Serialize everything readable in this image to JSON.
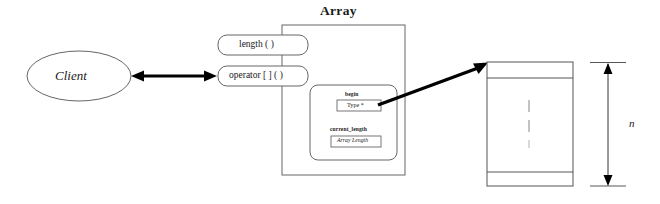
{
  "diagram": {
    "title": "Array",
    "actor": {
      "label": "Client",
      "shape": "ellipse"
    },
    "methods": [
      {
        "label": "length ( )",
        "name": "length-method"
      },
      {
        "label": "operator [ ] ( )",
        "name": "operator-index-method"
      }
    ],
    "members": [
      {
        "name_label": "begin",
        "type_label": "Type *",
        "italic": false
      },
      {
        "name_label": "current_length",
        "type_label": "Array Length",
        "italic": true
      }
    ],
    "memory_block": {
      "ellipsis": "vertical-dots",
      "cells": 3,
      "dimension_label": "n"
    },
    "connectors": [
      {
        "name": "client-array-association",
        "style": "double-headed-arrow"
      },
      {
        "name": "begin-pointer-arrow",
        "style": "single-headed-arrow"
      }
    ],
    "colors": {
      "stroke": "#555555",
      "arrow": "#000000",
      "text": "#1a1a1a",
      "background": "#ffffff",
      "ellipsis": "#b0b0b0"
    }
  }
}
